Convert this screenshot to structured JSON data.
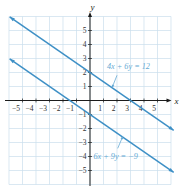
{
  "figure": {
    "kind": "textbook-graph",
    "colors": {
      "line": "#3e90c6",
      "annotation_text": "#66aad4",
      "grid": "#cadeec",
      "axis": "#1c1c1c",
      "tick_text": "#333333",
      "background": "#ffffff"
    }
  },
  "chart_data": {
    "type": "line",
    "title": "",
    "xlabel": "x",
    "ylabel": "y",
    "xlim": [
      -6,
      6
    ],
    "ylim": [
      -6,
      6
    ],
    "xticks": [
      -5,
      -4,
      -3,
      -2,
      -1,
      1,
      2,
      3,
      4,
      5
    ],
    "yticks": [
      -5,
      -4,
      -3,
      -2,
      -1,
      1,
      2,
      3,
      4,
      5
    ],
    "grid": true,
    "legend": null,
    "series": [
      {
        "name": "4x + 6y = 12",
        "equation": "4x + 6y = 12",
        "slope": -0.6667,
        "y_intercept": 2,
        "x_intercept": 3,
        "points": [
          [
            -6,
            6
          ],
          [
            -3,
            4
          ],
          [
            0,
            2
          ],
          [
            3,
            0
          ],
          [
            6,
            -2
          ]
        ],
        "draw_x_range": [
          -5.95,
          6.2
        ],
        "arrow_both_ends": true
      },
      {
        "name": "6x + 9y = −9",
        "equation": "6x + 9y = −9",
        "slope": -0.6667,
        "y_intercept": -1,
        "x_intercept": -1.5,
        "points": [
          [
            -6,
            3
          ],
          [
            -3,
            1
          ],
          [
            0,
            -1
          ],
          [
            3,
            -3
          ],
          [
            6,
            -5
          ]
        ],
        "draw_x_range": [
          -5.95,
          6.2
        ],
        "arrow_both_ends": true
      }
    ],
    "annotations": [
      {
        "text": "4x + 6y = 12",
        "at": [
          2.85,
          2.42
        ],
        "arrow_from": [
          2.0,
          1.8
        ],
        "arrow_to": [
          1.62,
          0.88
        ]
      },
      {
        "text": "6x + 9y = −9",
        "at": [
          1.9,
          -4.0
        ],
        "arrow_from": [
          2.05,
          -3.42
        ],
        "arrow_to": [
          2.45,
          -2.52
        ]
      }
    ]
  }
}
